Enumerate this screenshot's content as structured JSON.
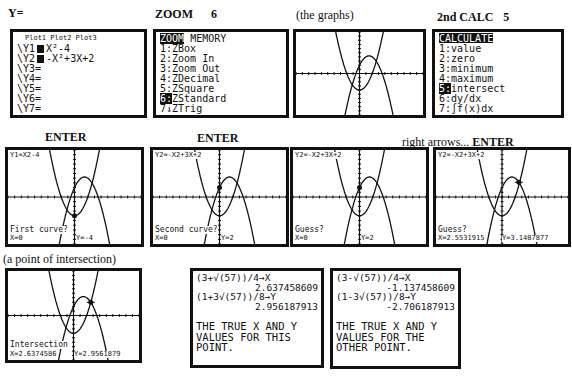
{
  "labels": {
    "y_equals": "Y=",
    "zoom_key": "ZOOM",
    "zoom_num": "6",
    "the_graphs": "(the graphs)",
    "calc_key": "2nd CALC",
    "calc_num": "5",
    "enter1": "ENTER",
    "enter2": "ENTER",
    "right_arrows": "right arrows...",
    "enter3": "ENTER",
    "point_of_intersection": "(a point of intersection)"
  },
  "y_editor": {
    "plots": "Plot1 Plot2 Plot3",
    "rows": [
      {
        "name": "\\Y1",
        "eq": "X²-4",
        "selected": true
      },
      {
        "name": "\\Y2",
        "eq": "-X²+3X+2",
        "selected": true
      },
      {
        "name": "\\Y3",
        "eq": "="
      },
      {
        "name": "\\Y4",
        "eq": "="
      },
      {
        "name": "\\Y5",
        "eq": "="
      },
      {
        "name": "\\Y6",
        "eq": "="
      },
      {
        "name": "\\Y7",
        "eq": "="
      }
    ]
  },
  "zoom_menu": {
    "tab_active": "ZOOM",
    "tab_other": "MEMORY",
    "items": [
      {
        "num": "1:",
        "label": "ZBox"
      },
      {
        "num": "2:",
        "label": "Zoom In"
      },
      {
        "num": "3:",
        "label": "Zoom Out"
      },
      {
        "num": "4:",
        "label": "ZDecimal"
      },
      {
        "num": "5:",
        "label": "ZSquare"
      },
      {
        "num": "6:",
        "label": "ZStandard",
        "selected": true
      },
      {
        "num": "7↓",
        "label": "ZTrig"
      }
    ]
  },
  "calc_menu": {
    "title": "CALCULATE",
    "items": [
      {
        "num": "1:",
        "label": "value"
      },
      {
        "num": "2:",
        "label": "zero"
      },
      {
        "num": "3:",
        "label": "minimum"
      },
      {
        "num": "4:",
        "label": "maximum"
      },
      {
        "num": "5:",
        "label": "intersect",
        "selected": true
      },
      {
        "num": "6:",
        "label": "dy/dx"
      },
      {
        "num": "7:",
        "label": "∫f(x)dx"
      }
    ]
  },
  "graph_screens": {
    "first_curve": {
      "eq": "Y1=X2-4",
      "prompt": "First curve?",
      "x": "X=0",
      "y": "Y=-4"
    },
    "second_curve": {
      "eq": "Y2=-X2+3X+2",
      "prompt": "Second curve?",
      "x": "X=0",
      "y": "Y=2"
    },
    "guess1": {
      "eq": "Y2=-X2+3X+2",
      "prompt": "Guess?",
      "x": "X=0",
      "y": "Y=2"
    },
    "guess2": {
      "eq": "Y2=-X2+3X+2",
      "prompt": "Guess?",
      "x": "X=2.5531915",
      "y": "Y=3.1407877"
    },
    "intersection": {
      "prompt": "Intersection",
      "x": "X=2.6374586",
      "y": "Y=2.9561879"
    }
  },
  "home_screens": {
    "this_point": {
      "lines": [
        "(3+√(57))/4→X",
        "2.637458609",
        "(1+3√(57))/8→Y",
        "2.956187913"
      ],
      "note": [
        "THE TRUE X AND Y",
        "VALUES FOR THIS",
        "POINT."
      ]
    },
    "other_point": {
      "lines": [
        "(3-√(57))/4→X",
        "-1.137458609",
        "(1-3√(57))/8→Y",
        "-2.706187913"
      ],
      "note": [
        "THE TRUE X AND Y",
        "VALUES FOR THE",
        "OTHER POINT."
      ]
    }
  }
}
